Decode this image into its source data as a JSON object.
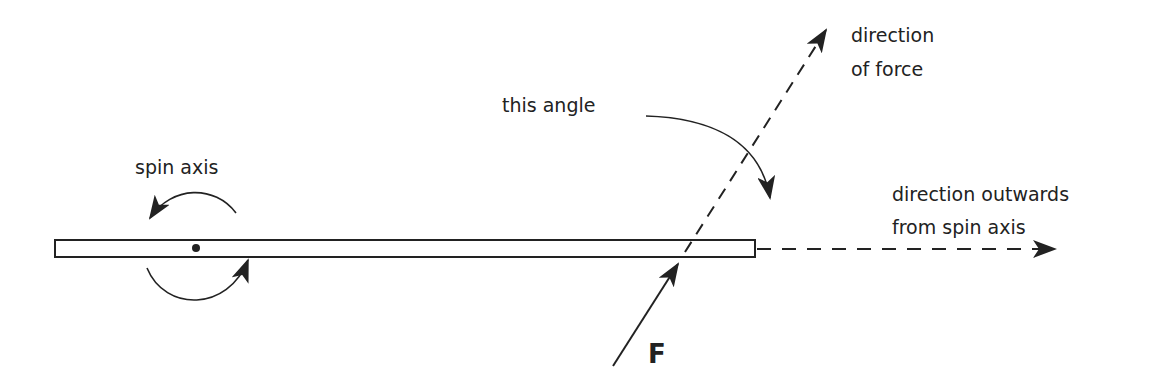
{
  "labels": {
    "spin_axis": "spin axis",
    "this_angle": "this angle",
    "direction_of_force_1": "direction",
    "direction_of_force_2": "of force",
    "direction_outwards_1": "direction outwards",
    "direction_outwards_2": "from spin axis",
    "force": "F"
  },
  "colors": {
    "stroke": "#222222",
    "background": "#ffffff"
  }
}
